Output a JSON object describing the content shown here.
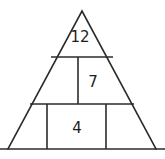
{
  "figure": {
    "type": "pyramid-number-puzzle",
    "title": "",
    "background_color": "#ffffff",
    "stroke_color": "#2b2b2b",
    "text_color": "#1d1d1d",
    "stroke_width": 1.6,
    "canvas": {
      "width": 165,
      "height": 159
    },
    "triangle": {
      "apex": {
        "x": 82,
        "y": 11
      },
      "base_left": {
        "x": 8,
        "y": 149
      },
      "base_right": {
        "x": 156,
        "y": 149
      }
    },
    "baseline": {
      "x1": 0,
      "y1": 149,
      "x2": 165,
      "y2": 149
    },
    "rows": [
      {
        "name": "top-row",
        "divider_y": 57,
        "divider_x1": 51,
        "divider_x2": 113
      },
      {
        "name": "middle-row",
        "divider_y": 104,
        "divider_x1": 30,
        "divider_x2": 134
      }
    ],
    "verticals": [
      {
        "name": "middle-row-divider",
        "x": 78,
        "y1": 57,
        "y2": 104
      },
      {
        "name": "bottom-row-divider-left",
        "x": 47,
        "y1": 104,
        "y2": 149
      },
      {
        "name": "bottom-row-divider-right",
        "x": 106,
        "y1": 104,
        "y2": 149
      }
    ],
    "cells": [
      {
        "id": "apex-cell",
        "label": "12",
        "x": 80,
        "y": 37
      },
      {
        "id": "middle-right-cell",
        "label": "7",
        "x": 93,
        "y": 82
      },
      {
        "id": "bottom-center-cell",
        "label": "4",
        "x": 77,
        "y": 128
      },
      {
        "id": "middle-left-cell",
        "label": "",
        "x": 55,
        "y": 82
      },
      {
        "id": "bottom-left-cell",
        "label": "",
        "x": 32,
        "y": 128
      },
      {
        "id": "bottom-right-cell",
        "label": "",
        "x": 126,
        "y": 128
      }
    ]
  }
}
